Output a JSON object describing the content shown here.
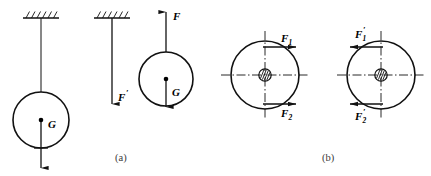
{
  "figure": {
    "background_color": "#ffffff",
    "ink_color": "#111111",
    "captions": [
      {
        "id": "caption-a",
        "text": "(a)"
      },
      {
        "id": "caption-b",
        "text": "(b)"
      }
    ],
    "panel_a": {
      "name": "hanging-ball-force-panel",
      "subfigures": [
        {
          "id": "ball-on-string",
          "description": "ball suspended from hatched ceiling by a string, weight G at center",
          "labels": [
            {
              "name": "weight-label-G",
              "text": "G",
              "prime": ""
            }
          ],
          "support": "hatched-ceiling",
          "vectors": [
            {
              "name": "weight-vector-G",
              "symbol": "G",
              "direction": "down"
            }
          ]
        },
        {
          "id": "string-reaction",
          "description": "string alone from hatched ceiling with downward reaction force",
          "labels": [
            {
              "name": "force-label-F-prime",
              "text": "F",
              "prime": "′"
            }
          ],
          "support": "hatched-ceiling",
          "vectors": [
            {
              "name": "reaction-vector-F-prime",
              "symbol": "F′",
              "direction": "down"
            }
          ]
        },
        {
          "id": "free-ball",
          "description": "isolated ball with upward tension F and downward weight G",
          "labels": [
            {
              "name": "force-label-F",
              "text": "F",
              "prime": ""
            },
            {
              "name": "weight-label-G",
              "text": "G",
              "prime": ""
            }
          ],
          "vectors": [
            {
              "name": "tension-vector-F",
              "symbol": "F",
              "direction": "up"
            },
            {
              "name": "weight-vector-G",
              "symbol": "G",
              "direction": "down"
            }
          ]
        }
      ]
    },
    "panel_b": {
      "name": "couple-on-wheel-panel",
      "subfigures": [
        {
          "id": "wheel-couple-left",
          "description": "hatched hub wheel with centerlines, F1 rightward at top and F2 rightward at bottom",
          "labels": [
            {
              "name": "force-label-F1",
              "text": "F",
              "sub": "1",
              "prime": ""
            },
            {
              "name": "force-label-F2",
              "text": "F",
              "sub": "2",
              "prime": ""
            }
          ],
          "vectors": [
            {
              "name": "force-vector-F1",
              "symbol": "F1",
              "direction": "right",
              "position": "top"
            },
            {
              "name": "force-vector-F2",
              "symbol": "F2",
              "direction": "right",
              "position": "bottom"
            }
          ]
        },
        {
          "id": "wheel-couple-right",
          "description": "hatched hub wheel with centerlines, F1 prime leftward at top and F2 prime leftward at bottom",
          "labels": [
            {
              "name": "force-label-F1-prime",
              "text": "F",
              "sub": "1",
              "prime": "′"
            },
            {
              "name": "force-label-F2-prime",
              "text": "F",
              "sub": "2",
              "prime": "′"
            }
          ],
          "vectors": [
            {
              "name": "force-vector-F1-prime",
              "symbol": "F1′",
              "direction": "left",
              "position": "top"
            },
            {
              "name": "force-vector-F2-prime",
              "symbol": "F2′",
              "direction": "left",
              "position": "bottom"
            }
          ]
        }
      ]
    }
  }
}
